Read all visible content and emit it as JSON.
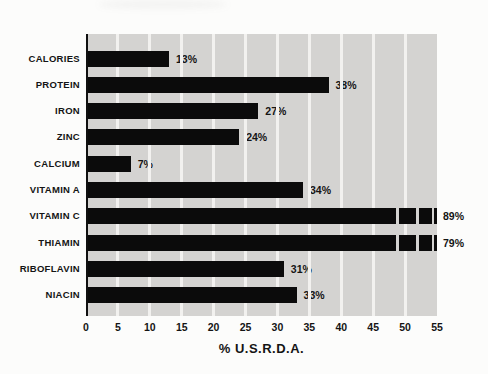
{
  "page": {
    "background": "#fcfcfb"
  },
  "chart_data": {
    "type": "bar",
    "orientation": "horizontal",
    "title": "",
    "xlabel": "% U.S.R.D.A.",
    "ylabel": "",
    "categories": [
      "CALORIES",
      "PROTEIN",
      "IRON",
      "ZINC",
      "CALCIUM",
      "VITAMIN A",
      "VITAMIN C",
      "THIAMIN",
      "RIBOFLAVIN",
      "NIACIN"
    ],
    "values": [
      13,
      38,
      27,
      24,
      7,
      34,
      89,
      79,
      31,
      33
    ],
    "value_labels": [
      "13%",
      "38%",
      "27%",
      "24%",
      "7%",
      "34%",
      "89%",
      "79%",
      "31%",
      "33%"
    ],
    "xlim": [
      0,
      55
    ],
    "xticks": [
      0,
      5,
      10,
      15,
      20,
      25,
      30,
      35,
      40,
      45,
      50,
      55
    ],
    "grid": "vertical white gridlines every 5 units, drawn behind bars",
    "legend": "none",
    "bar_color": "#0b0b0b",
    "plot_background": "#d4d3d1",
    "gridline_color": "#f2f1ef",
    "axis_line_color": "#101010",
    "text_color": "#141414",
    "overflow_note": "Bars whose value exceeds the 55% axis maximum (VITAMIN C 89%, THIAMIN 79%) are drawn broken: a solid bar then three diminishing segments separated by small white gaps, ending at the axis edge.",
    "overflow_break": {
      "solid_units": 48.6,
      "segments_units": [
        2.66,
        1.96,
        0.58
      ],
      "gaps_units": [
        0.47,
        0.47,
        0.39
      ]
    }
  }
}
